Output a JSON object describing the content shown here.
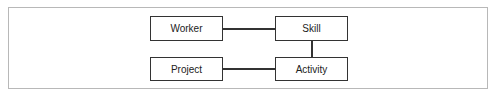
{
  "diagram": {
    "type": "entity-relationship",
    "nodes": [
      {
        "id": "worker",
        "label": "Worker"
      },
      {
        "id": "skill",
        "label": "Skill"
      },
      {
        "id": "project",
        "label": "Project"
      },
      {
        "id": "activity",
        "label": "Activity"
      }
    ],
    "edges": [
      {
        "from": "worker",
        "to": "skill"
      },
      {
        "from": "skill",
        "to": "activity"
      },
      {
        "from": "project",
        "to": "activity"
      }
    ]
  }
}
